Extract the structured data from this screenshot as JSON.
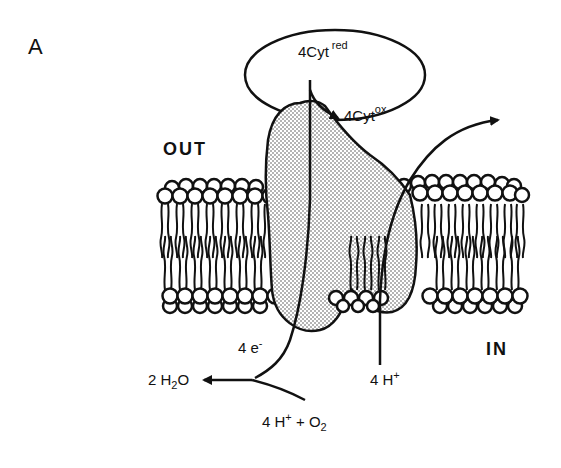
{
  "panel_label": "A",
  "compartments": {
    "out": "OUT",
    "in": "IN"
  },
  "cytochrome": {
    "reduced": {
      "coef": "4",
      "base": "Cyt",
      "sup": "red"
    },
    "oxidized": {
      "coef": "4",
      "base": "Cyt",
      "sup": "ox"
    }
  },
  "electrons": {
    "coef": "4 ",
    "base": "e",
    "sup": "-"
  },
  "pumped_protons": {
    "coef": "4 ",
    "base": "H",
    "sup": "+"
  },
  "substrates": {
    "text1": "4 H",
    "sup1": "+",
    "text2": " + O",
    "sub2": "2"
  },
  "product": {
    "text1": "2 H",
    "sub1": "2",
    "text2": "O"
  },
  "colors": {
    "line": "#111111",
    "protein_fill": "#d9d9d9",
    "background": "#ffffff"
  }
}
